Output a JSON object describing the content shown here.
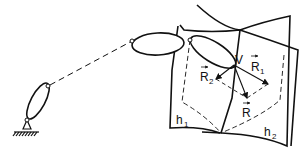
{
  "diagram": {
    "labels": {
      "point_v": "V",
      "r1": "R",
      "r1_sub": "1",
      "r2": "R",
      "r2_sub": "2",
      "r": "R",
      "h1": "h",
      "h1_sub": "1",
      "h2": "h",
      "h2_sub": "2"
    },
    "colors": {
      "stroke": "#111111",
      "background": "#ffffff"
    }
  }
}
